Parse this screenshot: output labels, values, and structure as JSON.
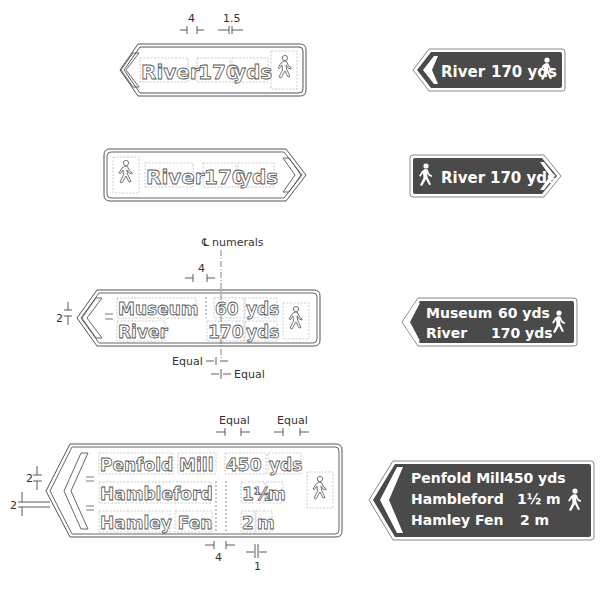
{
  "colors": {
    "sign_background": "#4a4a4a",
    "sign_text": "#ffffff",
    "outline": "#555555",
    "dimension_line": "#333333"
  },
  "sign1": {
    "direction": "left",
    "destination": "River",
    "distance_value": "170",
    "distance_unit": "yds",
    "symbol": "pedestrian-icon",
    "dimensions": {
      "gap_label": "4",
      "unit_gap_label": "1.5"
    }
  },
  "sign2": {
    "direction": "right",
    "destination": "River",
    "distance_value": "170",
    "distance_unit": "yds",
    "symbol": "pedestrian-icon"
  },
  "sign3": {
    "direction": "left",
    "centerline_label": "numerals",
    "rows": [
      {
        "destination": "Museum",
        "distance_value": "60",
        "distance_unit": "yds"
      },
      {
        "destination": "River",
        "distance_value": "170",
        "distance_unit": "yds"
      }
    ],
    "symbol": "pedestrian-icon",
    "dimensions": {
      "gap_label": "4",
      "row_gap_label": "2",
      "equal_label_1": "Equal",
      "equal_label_2": "Equal"
    }
  },
  "sign4": {
    "direction": "left",
    "rows": [
      {
        "destination": "Penfold Mill",
        "distance_value": "450",
        "distance_unit": "yds"
      },
      {
        "destination": "Hambleford",
        "distance_value": "1½",
        "distance_unit": "m"
      },
      {
        "destination": "Hamley Fen",
        "distance_value": "2",
        "distance_unit": "m"
      }
    ],
    "symbol": "pedestrian-icon",
    "dimensions": {
      "equal_label_1": "Equal",
      "equal_label_2": "Equal",
      "row_gap_label_1": "2",
      "row_gap_label_2": "2",
      "gap_label": "4",
      "unit_gap_label": "1"
    }
  },
  "solid_signs": {
    "s1": {
      "text_dest": "River",
      "text_dist": "170 yds"
    },
    "s2": {
      "text_dest": "River",
      "text_dist": "170 yds"
    },
    "s3": {
      "row1_dest": "Museum",
      "row1_dist": "60 yds",
      "row2_dest": "River",
      "row2_dist": "170 yds"
    },
    "s4": {
      "row1_dest": "Penfold Mill",
      "row1_dist": "450 yds",
      "row2_dest": "Hambleford",
      "row2_dist": "1½ m",
      "row3_dest": "Hamley Fen",
      "row3_dist": "2 m"
    }
  }
}
